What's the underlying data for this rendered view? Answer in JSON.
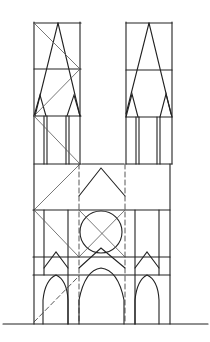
{
  "figure": {
    "stroke_color": "#222222",
    "background": "#ffffff"
  },
  "geometry": {
    "ground": {
      "x1": 3,
      "x2": 208,
      "y": 324
    },
    "left_tower": {
      "x1": 34,
      "x2": 80,
      "levels": [
        23,
        69,
        116,
        164
      ]
    },
    "right_tower": {
      "x1": 126,
      "x2": 172,
      "levels": [
        23,
        69,
        116,
        164
      ]
    },
    "body": {
      "x1": 33,
      "x2": 170,
      "levels": [
        164,
        210,
        257,
        275,
        324
      ]
    },
    "rose_window": {
      "cx": 101,
      "cy": 232,
      "r": 21,
      "square": [
        79,
        210,
        125,
        257
      ]
    }
  }
}
